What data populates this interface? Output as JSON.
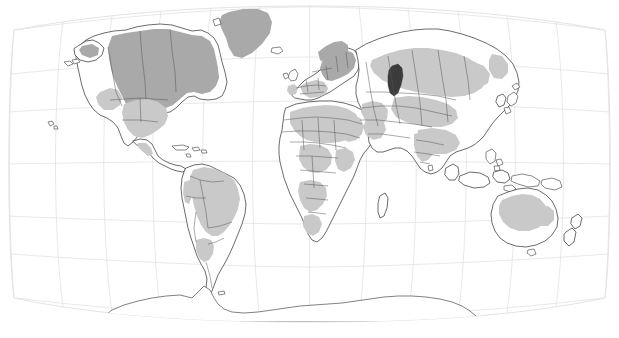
{
  "map": {
    "title": "World Map",
    "projection": "robinson-pseudocylindrical",
    "background_color": "#ffffff",
    "graticule_color": "#dedede",
    "coastline_color": "#3a3a3a",
    "border_color": "#555555",
    "region_fill_dark": "#a9a9a9",
    "region_fill_light": "#c9c9c9",
    "water_fill_dark": "#3c3c3c",
    "graticule": {
      "interval_degrees": 30,
      "meridians": [
        -180,
        -150,
        -120,
        -90,
        -60,
        -30,
        0,
        30,
        60,
        90,
        120,
        150,
        180
      ],
      "parallels": [
        -90,
        -60,
        -30,
        0,
        30,
        60,
        90
      ],
      "visible": true
    },
    "frame": {
      "left_px": 14,
      "right_px": 605,
      "top_px": 6,
      "bottom_px": 322
    },
    "legend": {
      "visible": false,
      "entries": [
        {
          "label": "dense shaded region",
          "color": "#a9a9a9"
        },
        {
          "label": "sparse shaded region",
          "color": "#c9c9c9"
        },
        {
          "label": "inland water body",
          "color": "#3c3c3c"
        },
        {
          "label": "unshaded land",
          "color": "#ffffff"
        }
      ]
    },
    "features": [
      {
        "name": "north-america",
        "shading": "dark"
      },
      {
        "name": "greenland",
        "shading": "dark"
      },
      {
        "name": "south-america",
        "shading": "light"
      },
      {
        "name": "africa",
        "shading": "light"
      },
      {
        "name": "europe",
        "shading": "dark"
      },
      {
        "name": "asia",
        "shading": "light"
      },
      {
        "name": "australia",
        "shading": "light"
      },
      {
        "name": "caspian-sea",
        "shading": "water-dark"
      },
      {
        "name": "antarctica",
        "shading": "none"
      },
      {
        "name": "madagascar",
        "shading": "none"
      },
      {
        "name": "new-zealand",
        "shading": "none"
      },
      {
        "name": "japan",
        "shading": "none"
      },
      {
        "name": "hawaii",
        "shading": "none"
      },
      {
        "name": "indonesia",
        "shading": "none"
      }
    ],
    "labels": [],
    "axis_labels": [],
    "annotations": []
  }
}
